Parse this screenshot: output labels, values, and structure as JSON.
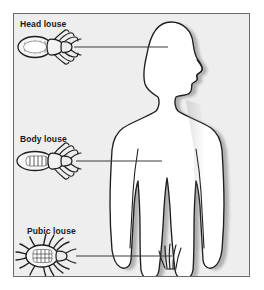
{
  "figure": {
    "background_color": "#eeeeee",
    "border_color": "#6b6b6b",
    "ink_color": "#1a1a1a",
    "silhouette_fill": "#ffffff",
    "width": 264,
    "height": 290
  },
  "labels": {
    "head_louse": "Head louse",
    "body_louse": "Body louse",
    "pubic_louse": "Pubic louse"
  },
  "callouts": [
    {
      "id": "head",
      "label": "Head louse",
      "specimen": "head-louse-illustration",
      "target_region": "scalp",
      "leader_from_x": 74,
      "leader_to_x": 168,
      "leader_y": 47
    },
    {
      "id": "body",
      "label": "Body louse",
      "specimen": "body-louse-illustration",
      "target_region": "torso",
      "leader_from_x": 76,
      "leader_to_x": 162,
      "leader_y": 161
    },
    {
      "id": "pubic",
      "label": "Pubic louse",
      "specimen": "pubic-louse-illustration",
      "target_region": "groin",
      "leader_from_x": 76,
      "leader_to_x": 172,
      "leader_y": 256
    }
  ],
  "anatomy": {
    "silhouette": "human-body-front-with-profile-head",
    "pubic_hair_tuft": "groin-hair-tuft"
  }
}
